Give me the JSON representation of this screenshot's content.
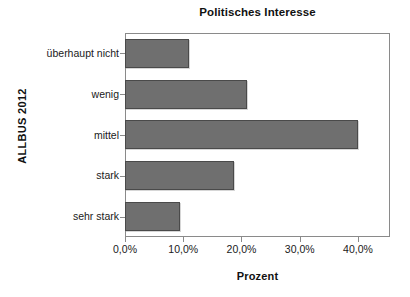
{
  "chart_data": {
    "type": "bar",
    "orientation": "horizontal",
    "title": "Politisches Interesse",
    "xlabel": "Prozent",
    "ylabel": "ALLBUS 2012",
    "categories": [
      "überhaupt nicht",
      "wenig",
      "mittel",
      "stark",
      "sehr stark"
    ],
    "values": [
      11.0,
      21.0,
      40.0,
      18.8,
      9.5
    ],
    "value_suffix": "%",
    "xlim": [
      0.0,
      45.5
    ],
    "xticks": [
      0.0,
      10.0,
      20.0,
      30.0,
      40.0
    ],
    "xtick_labels": [
      "0,0%",
      "10,0%",
      "20,0%",
      "30,0%",
      "40,0%"
    ],
    "grid": false,
    "legend": null,
    "bar_color": "#6f6f6f",
    "bar_border_color": "#4a4a4a",
    "frame_color": "#8a8a8a",
    "background": "#ffffff"
  }
}
